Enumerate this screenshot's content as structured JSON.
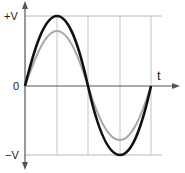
{
  "diagram": {
    "title": "",
    "labels": {
      "pos_peak": "+V",
      "zero": "0",
      "neg_peak": "−V",
      "time_axis": "t"
    },
    "colors": {
      "axis": "#555555",
      "grid": "#b8b8b8",
      "primary_wave": "#111111",
      "secondary_wave": "#a8a8a8",
      "background": "#ffffff"
    },
    "waves": [
      {
        "name": "primary",
        "type": "sine",
        "relative_amplitude": 1.0,
        "cycles": 1,
        "color": "#111111"
      },
      {
        "name": "secondary",
        "type": "sine",
        "relative_amplitude": 0.78,
        "cycles": 1,
        "color": "#a8a8a8"
      }
    ],
    "grid": {
      "vertical_divisions": 4,
      "horizontal_reference_lines": [
        "+V",
        "0",
        "−V"
      ]
    }
  }
}
